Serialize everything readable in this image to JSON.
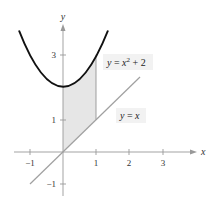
{
  "diagram": {
    "type": "function-graph",
    "axes": {
      "x_label": "x",
      "y_label": "y",
      "x_ticks": [
        {
          "value": -1,
          "label": "−1"
        },
        {
          "value": 1,
          "label": "1"
        },
        {
          "value": 2,
          "label": "2"
        },
        {
          "value": 3,
          "label": "3"
        }
      ],
      "y_ticks": [
        {
          "value": -1,
          "label": "−1"
        },
        {
          "value": 1,
          "label": "1"
        },
        {
          "value": 3,
          "label": "3"
        }
      ]
    },
    "curves": [
      {
        "name": "parabola",
        "equation": "y = x^2 + 2",
        "label_text": "y = x² + 2",
        "color": "#111111"
      },
      {
        "name": "line",
        "equation": "y = x",
        "label_text": "y = x",
        "color": "#999999"
      }
    ],
    "shaded_region": {
      "description": "Region between y = x^2 + 2 and y = x for 0 <= x <= 1",
      "x_from": 0,
      "x_to": 1,
      "fill": "#e6e6e6"
    },
    "labels": {
      "parabola_y": "y",
      "parabola_eq": " = ",
      "parabola_x": "x",
      "parabola_exp": "2",
      "parabola_rest": " + 2",
      "line_y": "y",
      "line_eq": " = ",
      "line_x": "x"
    }
  }
}
